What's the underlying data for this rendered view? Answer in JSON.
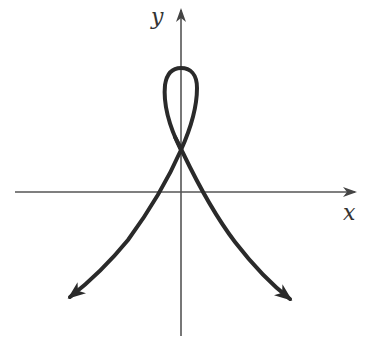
{
  "diagram": {
    "type": "parametric-curve-sketch",
    "axes": {
      "x_label": "x",
      "y_label": "y"
    },
    "colors": {
      "curve": "#2a2a2a",
      "axes": "#555555",
      "background": "#ffffff"
    },
    "features": {
      "loop_top": [
        181,
        68
      ],
      "self_intersection": [
        181,
        150
      ],
      "origin": [
        181,
        192
      ],
      "left_branch_end": [
        68,
        298
      ],
      "right_branch_end": [
        292,
        300
      ]
    }
  }
}
